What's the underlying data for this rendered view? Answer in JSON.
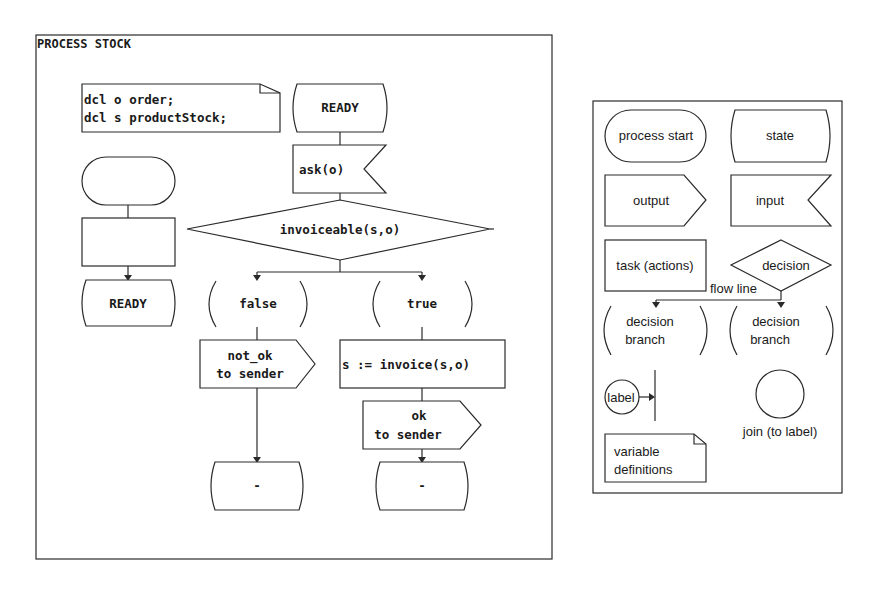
{
  "process": {
    "title": "PROCESS STOCK",
    "declarations": [
      "dcl o order;",
      "dcl s productStock;"
    ],
    "start_state": "READY",
    "input": "ask(o)",
    "decision": "invoiceable(s,o)",
    "branches": {
      "false": {
        "label": "false",
        "output_line1": "not_ok",
        "output_line2": "to sender",
        "next_state": "-"
      },
      "true": {
        "label": "true",
        "task": "s := invoice(s,o)",
        "output_line1": "ok",
        "output_line2": "to sender",
        "next_state": "-"
      }
    },
    "mini_example": {
      "state": "READY"
    }
  },
  "legend": {
    "process_start": "process start",
    "state": "state",
    "output": "output",
    "input": "input",
    "task": "task (actions)",
    "decision": "decision",
    "flow_line": "flow line",
    "branch1_line1": "decision",
    "branch1_line2": "branch",
    "branch2_line1": "decision",
    "branch2_line2": "branch",
    "label": "label",
    "join": "join (to label)",
    "variables_line1": "variable",
    "variables_line2": "definitions"
  },
  "colors": {
    "stroke": "#2a2a2a",
    "background": "#ffffff",
    "text": "#1a1a1a"
  }
}
